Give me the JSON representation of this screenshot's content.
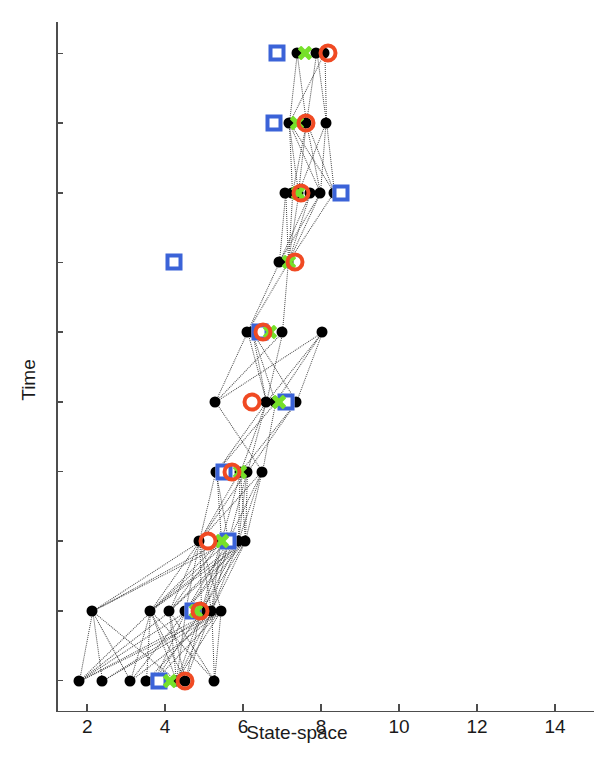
{
  "chart_data": {
    "type": "scatter",
    "title": "",
    "xlabel": "State-space",
    "ylabel": "Time",
    "xlim": [
      1.2,
      15.0
    ],
    "ylim": [
      0.55,
      10.45
    ],
    "xticks": [
      2,
      4,
      6,
      8,
      10,
      12,
      14
    ],
    "yticks": [
      1,
      2,
      3,
      4,
      5,
      6,
      7,
      8,
      9,
      10
    ],
    "xtick_labels": [
      "2",
      "4",
      "6",
      "8",
      "10",
      "12",
      "14"
    ],
    "ytick_labels": [
      "1",
      "2",
      "3",
      "4",
      "5",
      "6",
      "7",
      "8",
      "9",
      "10"
    ],
    "grid": false,
    "legend": "none",
    "colors": {
      "particle": "#000000",
      "square": "#3b63d8",
      "cross": "#76e02a",
      "circle": "#f04a23",
      "link": "#3a3a3a",
      "axis": "#4d4d4d"
    },
    "marker_styles": {
      "particle": "filled-circle",
      "square": "open-square",
      "cross": "x-cross",
      "circle": "open-circle"
    },
    "series": [
      {
        "name": "particles",
        "marker": "particle",
        "points": [
          {
            "t": 1,
            "x": 1.78
          },
          {
            "t": 1,
            "x": 2.37
          },
          {
            "t": 1,
            "x": 3.1
          },
          {
            "t": 1,
            "x": 3.52
          },
          {
            "t": 1,
            "x": 3.72
          },
          {
            "t": 1,
            "x": 4.28
          },
          {
            "t": 1,
            "x": 4.52
          },
          {
            "t": 1,
            "x": 5.25
          },
          {
            "t": 2,
            "x": 2.12
          },
          {
            "t": 2,
            "x": 3.62
          },
          {
            "t": 2,
            "x": 4.1
          },
          {
            "t": 2,
            "x": 4.52
          },
          {
            "t": 2,
            "x": 4.92
          },
          {
            "t": 2,
            "x": 5.18
          },
          {
            "t": 2,
            "x": 5.42
          },
          {
            "t": 3,
            "x": 4.88
          },
          {
            "t": 3,
            "x": 5.42
          },
          {
            "t": 3,
            "x": 5.62
          },
          {
            "t": 3,
            "x": 5.88
          },
          {
            "t": 3,
            "x": 6.05
          },
          {
            "t": 4,
            "x": 5.3
          },
          {
            "t": 4,
            "x": 5.92
          },
          {
            "t": 4,
            "x": 6.1
          },
          {
            "t": 4,
            "x": 6.48
          },
          {
            "t": 5,
            "x": 5.28
          },
          {
            "t": 5,
            "x": 6.58
          },
          {
            "t": 5,
            "x": 6.82
          },
          {
            "t": 5,
            "x": 7.35
          },
          {
            "t": 6,
            "x": 6.1
          },
          {
            "t": 6,
            "x": 6.22
          },
          {
            "t": 6,
            "x": 7.0
          },
          {
            "t": 6,
            "x": 8.02
          },
          {
            "t": 7,
            "x": 6.92
          },
          {
            "t": 7,
            "x": 7.15
          },
          {
            "t": 8,
            "x": 7.08
          },
          {
            "t": 8,
            "x": 7.26
          },
          {
            "t": 8,
            "x": 7.42
          },
          {
            "t": 8,
            "x": 7.72
          },
          {
            "t": 8,
            "x": 7.98
          },
          {
            "t": 8,
            "x": 8.32
          },
          {
            "t": 9,
            "x": 7.18
          },
          {
            "t": 9,
            "x": 7.62
          },
          {
            "t": 9,
            "x": 8.12
          },
          {
            "t": 10,
            "x": 7.38
          },
          {
            "t": 10,
            "x": 7.88
          },
          {
            "t": 10,
            "x": 8.08
          }
        ]
      },
      {
        "name": "blue-square-estimate",
        "marker": "square",
        "points": [
          {
            "t": 1,
            "x": 3.85
          },
          {
            "t": 2,
            "x": 4.72
          },
          {
            "t": 3,
            "x": 5.6
          },
          {
            "t": 4,
            "x": 5.52
          },
          {
            "t": 5,
            "x": 7.1
          },
          {
            "t": 6,
            "x": 6.42
          },
          {
            "t": 7,
            "x": 4.22
          },
          {
            "t": 8,
            "x": 8.52
          },
          {
            "t": 9,
            "x": 6.8
          },
          {
            "t": 10,
            "x": 6.88
          }
        ]
      },
      {
        "name": "green-cross-estimate",
        "marker": "cross",
        "points": [
          {
            "t": 1,
            "x": 4.12
          },
          {
            "t": 2,
            "x": 4.78
          },
          {
            "t": 3,
            "x": 5.45
          },
          {
            "t": 4,
            "x": 5.92
          },
          {
            "t": 5,
            "x": 6.92
          },
          {
            "t": 6,
            "x": 6.68
          },
          {
            "t": 7,
            "x": 7.18
          },
          {
            "t": 8,
            "x": 7.4
          },
          {
            "t": 9,
            "x": 7.38
          },
          {
            "t": 10,
            "x": 7.58
          }
        ]
      },
      {
        "name": "red-circle-truth",
        "marker": "circle",
        "points": [
          {
            "t": 1,
            "x": 4.5
          },
          {
            "t": 2,
            "x": 4.9
          },
          {
            "t": 3,
            "x": 5.1
          },
          {
            "t": 4,
            "x": 5.72
          },
          {
            "t": 5,
            "x": 6.22
          },
          {
            "t": 6,
            "x": 6.52
          },
          {
            "t": 7,
            "x": 7.32
          },
          {
            "t": 8,
            "x": 7.48
          },
          {
            "t": 9,
            "x": 7.62
          },
          {
            "t": 10,
            "x": 8.18
          }
        ]
      }
    ]
  }
}
